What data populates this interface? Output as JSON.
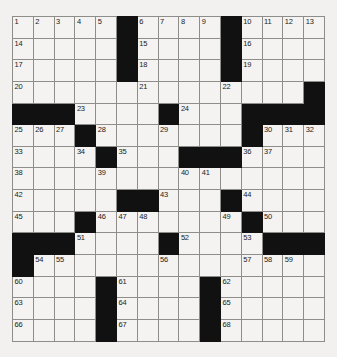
{
  "puzzle": {
    "type": "crossword-grid",
    "rows": 15,
    "cols": 15,
    "cell_size_px": 21,
    "colors": {
      "page_background": "#f2f1ef",
      "cell_fill": "#f4f3f1",
      "block_fill": "#111111",
      "grid_line": "#8d8d8a",
      "outer_border": "#4a4a48",
      "number_text": "#1b1b1b"
    },
    "max_clue_number": 68,
    "grid": [
      {
        "row": 0,
        "cells": [
          {
            "state": "open",
            "number": "1"
          },
          {
            "state": "open",
            "number": "2"
          },
          {
            "state": "open",
            "number": "3"
          },
          {
            "state": "open",
            "number": "4"
          },
          {
            "state": "open",
            "number": "5"
          },
          {
            "state": "block",
            "number": ""
          },
          {
            "state": "open",
            "number": "6"
          },
          {
            "state": "open",
            "number": "7"
          },
          {
            "state": "open",
            "number": "8"
          },
          {
            "state": "open",
            "number": "9"
          },
          {
            "state": "block",
            "number": ""
          },
          {
            "state": "open",
            "number": "10"
          },
          {
            "state": "open",
            "number": "11"
          },
          {
            "state": "open",
            "number": "12"
          },
          {
            "state": "open",
            "number": "13"
          }
        ]
      },
      {
        "row": 1,
        "cells": [
          {
            "state": "open",
            "number": "14"
          },
          {
            "state": "open",
            "number": ""
          },
          {
            "state": "open",
            "number": ""
          },
          {
            "state": "open",
            "number": ""
          },
          {
            "state": "open",
            "number": ""
          },
          {
            "state": "block",
            "number": ""
          },
          {
            "state": "open",
            "number": "15"
          },
          {
            "state": "open",
            "number": ""
          },
          {
            "state": "open",
            "number": ""
          },
          {
            "state": "open",
            "number": ""
          },
          {
            "state": "block",
            "number": ""
          },
          {
            "state": "open",
            "number": "16"
          },
          {
            "state": "open",
            "number": ""
          },
          {
            "state": "open",
            "number": ""
          },
          {
            "state": "open",
            "number": ""
          }
        ]
      },
      {
        "row": 2,
        "cells": [
          {
            "state": "open",
            "number": "17"
          },
          {
            "state": "open",
            "number": ""
          },
          {
            "state": "open",
            "number": ""
          },
          {
            "state": "open",
            "number": ""
          },
          {
            "state": "open",
            "number": ""
          },
          {
            "state": "block",
            "number": ""
          },
          {
            "state": "open",
            "number": "18"
          },
          {
            "state": "open",
            "number": ""
          },
          {
            "state": "open",
            "number": ""
          },
          {
            "state": "open",
            "number": ""
          },
          {
            "state": "block",
            "number": ""
          },
          {
            "state": "open",
            "number": "19"
          },
          {
            "state": "open",
            "number": ""
          },
          {
            "state": "open",
            "number": ""
          },
          {
            "state": "open",
            "number": ""
          }
        ]
      },
      {
        "row": 3,
        "cells": [
          {
            "state": "open",
            "number": "20"
          },
          {
            "state": "open",
            "number": ""
          },
          {
            "state": "open",
            "number": ""
          },
          {
            "state": "open",
            "number": ""
          },
          {
            "state": "open",
            "number": ""
          },
          {
            "state": "open",
            "number": ""
          },
          {
            "state": "open",
            "number": "21"
          },
          {
            "state": "open",
            "number": ""
          },
          {
            "state": "open",
            "number": ""
          },
          {
            "state": "open",
            "number": ""
          },
          {
            "state": "open",
            "number": "22"
          },
          {
            "state": "open",
            "number": ""
          },
          {
            "state": "open",
            "number": ""
          },
          {
            "state": "open",
            "number": ""
          },
          {
            "state": "block",
            "number": ""
          }
        ]
      },
      {
        "row": 4,
        "cells": [
          {
            "state": "block",
            "number": ""
          },
          {
            "state": "block",
            "number": ""
          },
          {
            "state": "block",
            "number": ""
          },
          {
            "state": "open",
            "number": "23"
          },
          {
            "state": "open",
            "number": ""
          },
          {
            "state": "open",
            "number": ""
          },
          {
            "state": "open",
            "number": ""
          },
          {
            "state": "block",
            "number": ""
          },
          {
            "state": "open",
            "number": "24"
          },
          {
            "state": "open",
            "number": ""
          },
          {
            "state": "open",
            "number": ""
          },
          {
            "state": "block",
            "number": ""
          },
          {
            "state": "block",
            "number": ""
          },
          {
            "state": "block",
            "number": ""
          },
          {
            "state": "block",
            "number": ""
          }
        ]
      },
      {
        "row": 5,
        "cells": [
          {
            "state": "open",
            "number": "25"
          },
          {
            "state": "open",
            "number": "26"
          },
          {
            "state": "open",
            "number": "27"
          },
          {
            "state": "block",
            "number": ""
          },
          {
            "state": "open",
            "number": "28"
          },
          {
            "state": "open",
            "number": ""
          },
          {
            "state": "open",
            "number": ""
          },
          {
            "state": "open",
            "number": "29"
          },
          {
            "state": "open",
            "number": ""
          },
          {
            "state": "open",
            "number": ""
          },
          {
            "state": "open",
            "number": ""
          },
          {
            "state": "block",
            "number": ""
          },
          {
            "state": "open",
            "number": "30"
          },
          {
            "state": "open",
            "number": "31"
          },
          {
            "state": "open",
            "number": "32"
          }
        ]
      },
      {
        "row": 6,
        "cells": [
          {
            "state": "open",
            "number": "33"
          },
          {
            "state": "open",
            "number": ""
          },
          {
            "state": "open",
            "number": ""
          },
          {
            "state": "open",
            "number": "34"
          },
          {
            "state": "block",
            "number": ""
          },
          {
            "state": "open",
            "number": "35"
          },
          {
            "state": "open",
            "number": ""
          },
          {
            "state": "open",
            "number": ""
          },
          {
            "state": "block",
            "number": ""
          },
          {
            "state": "block",
            "number": ""
          },
          {
            "state": "block",
            "number": ""
          },
          {
            "state": "open",
            "number": "36"
          },
          {
            "state": "open",
            "number": "37"
          },
          {
            "state": "open",
            "number": ""
          },
          {
            "state": "open",
            "number": ""
          }
        ]
      },
      {
        "row": 7,
        "cells": [
          {
            "state": "open",
            "number": "38"
          },
          {
            "state": "open",
            "number": ""
          },
          {
            "state": "open",
            "number": ""
          },
          {
            "state": "open",
            "number": ""
          },
          {
            "state": "open",
            "number": "39"
          },
          {
            "state": "open",
            "number": ""
          },
          {
            "state": "open",
            "number": ""
          },
          {
            "state": "open",
            "number": ""
          },
          {
            "state": "open",
            "number": "40"
          },
          {
            "state": "open",
            "number": "41"
          },
          {
            "state": "open",
            "number": ""
          },
          {
            "state": "open",
            "number": ""
          },
          {
            "state": "open",
            "number": ""
          },
          {
            "state": "open",
            "number": ""
          },
          {
            "state": "open",
            "number": ""
          }
        ]
      },
      {
        "row": 8,
        "cells": [
          {
            "state": "open",
            "number": "42"
          },
          {
            "state": "open",
            "number": ""
          },
          {
            "state": "open",
            "number": ""
          },
          {
            "state": "open",
            "number": ""
          },
          {
            "state": "open",
            "number": ""
          },
          {
            "state": "block",
            "number": ""
          },
          {
            "state": "block",
            "number": ""
          },
          {
            "state": "open",
            "number": "43"
          },
          {
            "state": "open",
            "number": ""
          },
          {
            "state": "open",
            "number": ""
          },
          {
            "state": "block",
            "number": ""
          },
          {
            "state": "open",
            "number": "44"
          },
          {
            "state": "open",
            "number": ""
          },
          {
            "state": "open",
            "number": ""
          },
          {
            "state": "open",
            "number": ""
          }
        ]
      },
      {
        "row": 9,
        "cells": [
          {
            "state": "open",
            "number": "45"
          },
          {
            "state": "open",
            "number": ""
          },
          {
            "state": "open",
            "number": ""
          },
          {
            "state": "block",
            "number": ""
          },
          {
            "state": "open",
            "number": "46"
          },
          {
            "state": "open",
            "number": "47"
          },
          {
            "state": "open",
            "number": "48"
          },
          {
            "state": "open",
            "number": ""
          },
          {
            "state": "open",
            "number": ""
          },
          {
            "state": "open",
            "number": ""
          },
          {
            "state": "open",
            "number": "49"
          },
          {
            "state": "block",
            "number": ""
          },
          {
            "state": "open",
            "number": "50"
          },
          {
            "state": "open",
            "number": ""
          },
          {
            "state": "open",
            "number": ""
          }
        ]
      },
      {
        "row": 10,
        "cells": [
          {
            "state": "block",
            "number": ""
          },
          {
            "state": "block",
            "number": ""
          },
          {
            "state": "block",
            "number": ""
          },
          {
            "state": "open",
            "number": "51"
          },
          {
            "state": "open",
            "number": ""
          },
          {
            "state": "open",
            "number": ""
          },
          {
            "state": "open",
            "number": ""
          },
          {
            "state": "block",
            "number": ""
          },
          {
            "state": "open",
            "number": "52"
          },
          {
            "state": "open",
            "number": ""
          },
          {
            "state": "open",
            "number": ""
          },
          {
            "state": "open",
            "number": "53"
          },
          {
            "state": "block",
            "number": ""
          },
          {
            "state": "block",
            "number": ""
          },
          {
            "state": "block",
            "number": ""
          }
        ]
      },
      {
        "row": 11,
        "cells": [
          {
            "state": "block",
            "number": ""
          },
          {
            "state": "open",
            "number": "54"
          },
          {
            "state": "open",
            "number": "55"
          },
          {
            "state": "open",
            "number": ""
          },
          {
            "state": "open",
            "number": ""
          },
          {
            "state": "open",
            "number": ""
          },
          {
            "state": "open",
            "number": ""
          },
          {
            "state": "open",
            "number": "56"
          },
          {
            "state": "open",
            "number": ""
          },
          {
            "state": "open",
            "number": ""
          },
          {
            "state": "open",
            "number": ""
          },
          {
            "state": "open",
            "number": "57"
          },
          {
            "state": "open",
            "number": "58"
          },
          {
            "state": "open",
            "number": "59"
          },
          {
            "state": "open",
            "number": ""
          }
        ]
      },
      {
        "row": 12,
        "cells": [
          {
            "state": "open",
            "number": "60"
          },
          {
            "state": "open",
            "number": ""
          },
          {
            "state": "open",
            "number": ""
          },
          {
            "state": "open",
            "number": ""
          },
          {
            "state": "block",
            "number": ""
          },
          {
            "state": "open",
            "number": "61"
          },
          {
            "state": "open",
            "number": ""
          },
          {
            "state": "open",
            "number": ""
          },
          {
            "state": "open",
            "number": ""
          },
          {
            "state": "block",
            "number": ""
          },
          {
            "state": "open",
            "number": "62"
          },
          {
            "state": "open",
            "number": ""
          },
          {
            "state": "open",
            "number": ""
          },
          {
            "state": "open",
            "number": ""
          },
          {
            "state": "open",
            "number": ""
          }
        ]
      },
      {
        "row": 13,
        "cells": [
          {
            "state": "open",
            "number": "63"
          },
          {
            "state": "open",
            "number": ""
          },
          {
            "state": "open",
            "number": ""
          },
          {
            "state": "open",
            "number": ""
          },
          {
            "state": "block",
            "number": ""
          },
          {
            "state": "open",
            "number": "64"
          },
          {
            "state": "open",
            "number": ""
          },
          {
            "state": "open",
            "number": ""
          },
          {
            "state": "open",
            "number": ""
          },
          {
            "state": "block",
            "number": ""
          },
          {
            "state": "open",
            "number": "65"
          },
          {
            "state": "open",
            "number": ""
          },
          {
            "state": "open",
            "number": ""
          },
          {
            "state": "open",
            "number": ""
          },
          {
            "state": "open",
            "number": ""
          }
        ]
      },
      {
        "row": 14,
        "cells": [
          {
            "state": "open",
            "number": "66"
          },
          {
            "state": "open",
            "number": ""
          },
          {
            "state": "open",
            "number": ""
          },
          {
            "state": "open",
            "number": ""
          },
          {
            "state": "block",
            "number": ""
          },
          {
            "state": "open",
            "number": "67"
          },
          {
            "state": "open",
            "number": ""
          },
          {
            "state": "open",
            "number": ""
          },
          {
            "state": "open",
            "number": ""
          },
          {
            "state": "block",
            "number": ""
          },
          {
            "state": "open",
            "number": "68"
          },
          {
            "state": "open",
            "number": ""
          },
          {
            "state": "open",
            "number": ""
          },
          {
            "state": "open",
            "number": ""
          },
          {
            "state": "open",
            "number": ""
          }
        ]
      }
    ]
  }
}
